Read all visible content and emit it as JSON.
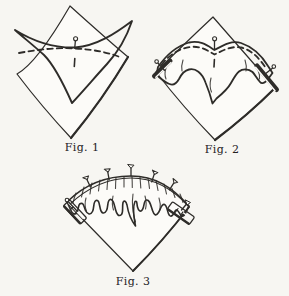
{
  "figures": [
    {
      "id": "fig-1",
      "caption": "Fig. 1"
    },
    {
      "id": "fig-2",
      "caption": "Fig. 2"
    },
    {
      "id": "fig-3",
      "caption": "Fig. 3"
    }
  ],
  "colors": {
    "bg": "#f7f6f2",
    "paper": "#fcfbf8",
    "fabric": "#d9d8d4",
    "fabric_dot": "#c8c7c2",
    "ink": "#2e2c29",
    "text": "#23211e"
  }
}
